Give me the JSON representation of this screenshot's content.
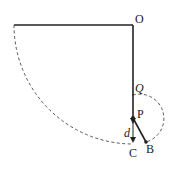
{
  "diagram": {
    "type": "physics-pendulum",
    "labels": {
      "O": "O",
      "Q": "Q",
      "P": "P",
      "B": "B",
      "C": "C",
      "d": "d"
    },
    "colors": {
      "line": "#222222",
      "dashed": "#444444",
      "background": "#ffffff"
    },
    "points": {
      "O": [
        133,
        25
      ],
      "start": [
        14,
        25
      ],
      "Q": [
        133,
        95
      ],
      "P": [
        133,
        118
      ],
      "B": [
        146,
        142
      ],
      "C": [
        133,
        145
      ]
    }
  }
}
